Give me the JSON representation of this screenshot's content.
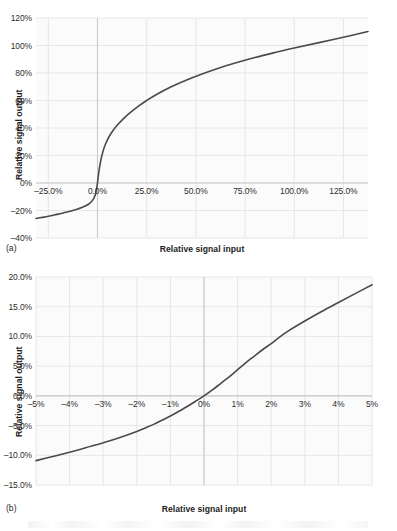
{
  "figure": {
    "panel_a_label": "(a)",
    "panel_b_label": "(b)"
  },
  "chart_data": [
    {
      "id": "a",
      "type": "line",
      "title": "",
      "xlabel": "Relative signal input",
      "ylabel": "Relative signal output",
      "xlim": [
        -31.25,
        137.5
      ],
      "ylim": [
        -40,
        120
      ],
      "xticks": [
        -25,
        0,
        25,
        50,
        75,
        100,
        125
      ],
      "xticklabels": [
        "–25.0%",
        "0.0%",
        "25.0%",
        "50.0%",
        "75.0%",
        "100.0%",
        "125.0%"
      ],
      "yticks": [
        -40,
        -20,
        0,
        20,
        40,
        60,
        80,
        100,
        120
      ],
      "yticklabels": [
        "–40%",
        "–20%",
        "0%",
        "20%",
        "40%",
        "60%",
        "80%",
        "100%",
        "120%"
      ],
      "grid": true,
      "legend": "none",
      "line_color": "#4a4a4a",
      "x": [
        -31.25,
        -28,
        -25,
        -22,
        -19,
        -16,
        -13,
        -10,
        -8,
        -6,
        -5,
        -4,
        -3,
        -2,
        -1.5,
        -1,
        -0.5,
        0,
        0.5,
        1,
        1.5,
        2,
        3,
        4,
        5,
        6,
        8,
        10,
        13,
        16,
        20,
        25,
        30,
        37.5,
        45,
        52.5,
        60,
        70,
        80,
        90,
        100,
        112,
        125,
        137.5
      ],
      "y": [
        -25.8,
        -25.0,
        -24.2,
        -23.3,
        -22.3,
        -21.3,
        -20.2,
        -18.9,
        -17.9,
        -16.6,
        -15.8,
        -14.8,
        -13.5,
        -11.5,
        -10.0,
        -8.0,
        -4.6,
        0.0,
        6.0,
        11.0,
        15.0,
        18.5,
        24.0,
        28.0,
        31.2,
        34.0,
        38.4,
        42.0,
        46.5,
        50.4,
        55.0,
        60.0,
        64.4,
        70.0,
        74.8,
        79.0,
        82.8,
        87.2,
        91.2,
        94.8,
        98.2,
        101.9,
        106.0,
        110.2
      ],
      "series": [
        {
          "name": "signal transfer",
          "color": "#4a4a4a"
        }
      ]
    },
    {
      "id": "b",
      "type": "line",
      "title": "",
      "xlabel": "Relative signal input",
      "ylabel": "Relative signal output",
      "xlim": [
        -5,
        5
      ],
      "ylim": [
        -15,
        20
      ],
      "xticks": [
        -5,
        -4,
        -3,
        -2,
        -1,
        0,
        1,
        2,
        3,
        4,
        5
      ],
      "xticklabels": [
        "–5%",
        "–4%",
        "–3%",
        "–2%",
        "–1%",
        "0%",
        "1%",
        "2%",
        "3%",
        "4%",
        "5%"
      ],
      "yticks": [
        -15,
        -10,
        -5,
        0,
        5,
        10,
        15,
        20
      ],
      "yticklabels": [
        "–15.0%",
        "–10.0%",
        "–5.0%",
        "0.0%",
        "5.0%",
        "10.0%",
        "15.0%",
        "20.0%"
      ],
      "grid": true,
      "legend": "none",
      "line_color": "#4a4a4a",
      "x": [
        -5,
        -4.5,
        -4,
        -3.5,
        -3,
        -2.5,
        -2,
        -1.75,
        -1.5,
        -1.25,
        -1,
        -0.75,
        -0.5,
        -0.25,
        0,
        0.25,
        0.5,
        0.75,
        1,
        1.25,
        1.5,
        1.75,
        2,
        2.25,
        2.5,
        3,
        3.5,
        4,
        4.5,
        5
      ],
      "y": [
        -10.9,
        -10.2,
        -9.5,
        -8.7,
        -7.9,
        -7.0,
        -6.0,
        -5.4,
        -4.8,
        -4.1,
        -3.4,
        -2.6,
        -1.8,
        -0.9,
        0.0,
        1.0,
        2.1,
        3.2,
        4.4,
        5.6,
        6.7,
        7.8,
        8.8,
        9.9,
        10.9,
        12.6,
        14.2,
        15.7,
        17.2,
        18.7
      ],
      "series": [
        {
          "name": "signal transfer",
          "color": "#4a4a4a"
        }
      ]
    }
  ],
  "colors": {
    "line": "#4a4a4a",
    "grid": "#e6e6e6",
    "axis": "#c9c9c9",
    "plot_bg": "#fbfbfb",
    "text": "#2b2b2b"
  }
}
